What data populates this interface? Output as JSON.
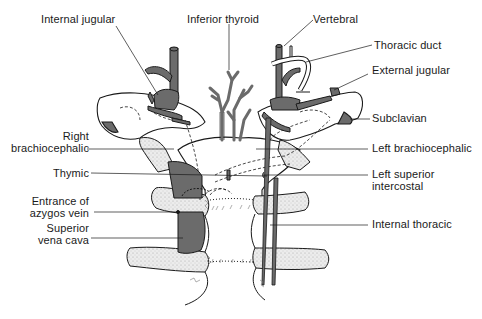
{
  "figure": {
    "colors": {
      "line": "#1a1a1a",
      "vein_fill": "#6b6b6b",
      "bone_fill": "#e6e6e6",
      "background": "#ffffff"
    }
  },
  "labels": {
    "internal_jugular": "Internal jugular",
    "inferior_thyroid": "Inferior thyroid",
    "vertebral": "Vertebral",
    "thoracic_duct": "Thoracic duct",
    "external_jugular": "External jugular",
    "subclavian": "Subclavian",
    "right_brachiocephalic_1": "Right",
    "right_brachiocephalic_2": "brachiocephalic",
    "left_brachiocephalic": "Left brachiocephalic",
    "thymic": "Thymic",
    "left_superior_intercostal_1": "Left superior",
    "left_superior_intercostal_2": "intercostal",
    "entrance_azygos_1": "Entrance of",
    "entrance_azygos_2": "azygos vein",
    "superior_vena_cava_1": "Superior",
    "superior_vena_cava_2": "vena cava",
    "internal_thoracic": "Internal thoracic"
  }
}
